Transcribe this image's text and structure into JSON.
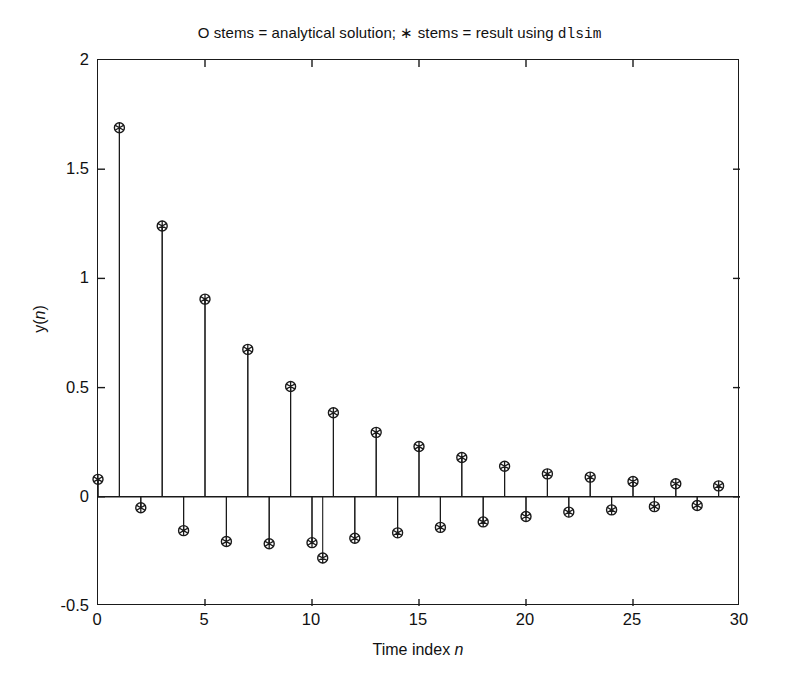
{
  "chart_data": {
    "type": "scatter",
    "plot_style": "stem",
    "title_parts": {
      "text": "O stems = analytical solution; ∗ stems = result using ",
      "mono": "dlsim"
    },
    "xlabel": "Time index n",
    "xlabel_text": "Time index ",
    "xlabel_italic": "n",
    "ylabel": "y(n)",
    "ylabel_prefix": "y(",
    "ylabel_italic": "n",
    "ylabel_suffix": ")",
    "xlim": [
      0,
      30
    ],
    "ylim": [
      -0.5,
      2
    ],
    "xticks": [
      0,
      5,
      10,
      15,
      20,
      25,
      30
    ],
    "xticklabels": [
      "0",
      "5",
      "10",
      "15",
      "20",
      "25",
      "30"
    ],
    "yticks": [
      -0.5,
      0,
      0.5,
      1,
      1.5,
      2
    ],
    "yticklabels": [
      "-0.5",
      "0",
      "0.5",
      "1",
      "1.5",
      "2"
    ],
    "grid": false,
    "legend": "none",
    "legend_in_title": true,
    "x": [
      0,
      1,
      2,
      3,
      4,
      5,
      6,
      7,
      8,
      9,
      10,
      11,
      12,
      13,
      14,
      15,
      16,
      17,
      18,
      19,
      20,
      21,
      22,
      23,
      24,
      25,
      26,
      27,
      28,
      29
    ],
    "series": [
      {
        "name": "analytical solution",
        "marker": "o",
        "values": [
          0.08,
          1.69,
          -0.05,
          1.24,
          -0.155,
          0.905,
          -0.205,
          0.675,
          -0.215,
          0.505,
          -0.21,
          0.385,
          -0.19,
          0.295,
          -0.165,
          0.23,
          -0.14,
          0.18,
          -0.115,
          0.14,
          -0.09,
          0.105,
          -0.07,
          0.09,
          -0.06,
          0.07,
          -0.045,
          0.06,
          -0.04,
          0.05
        ]
      },
      {
        "name": "result using dlsim",
        "marker": "*",
        "values": [
          0.08,
          1.69,
          -0.05,
          1.24,
          -0.155,
          0.905,
          -0.205,
          0.675,
          -0.215,
          0.505,
          -0.21,
          0.385,
          -0.19,
          0.295,
          -0.165,
          0.23,
          -0.14,
          0.18,
          -0.115,
          0.14,
          -0.09,
          0.105,
          -0.07,
          0.09,
          -0.06,
          0.07,
          -0.045,
          0.06,
          -0.04,
          0.05
        ]
      }
    ],
    "extra_points": [
      {
        "x": 10.5,
        "y": -0.28,
        "note": "lowest negative stem marker"
      }
    ]
  },
  "colors": {
    "axis": "#1a1a1a",
    "marker": "#1a1a1a",
    "background": "#ffffff"
  }
}
